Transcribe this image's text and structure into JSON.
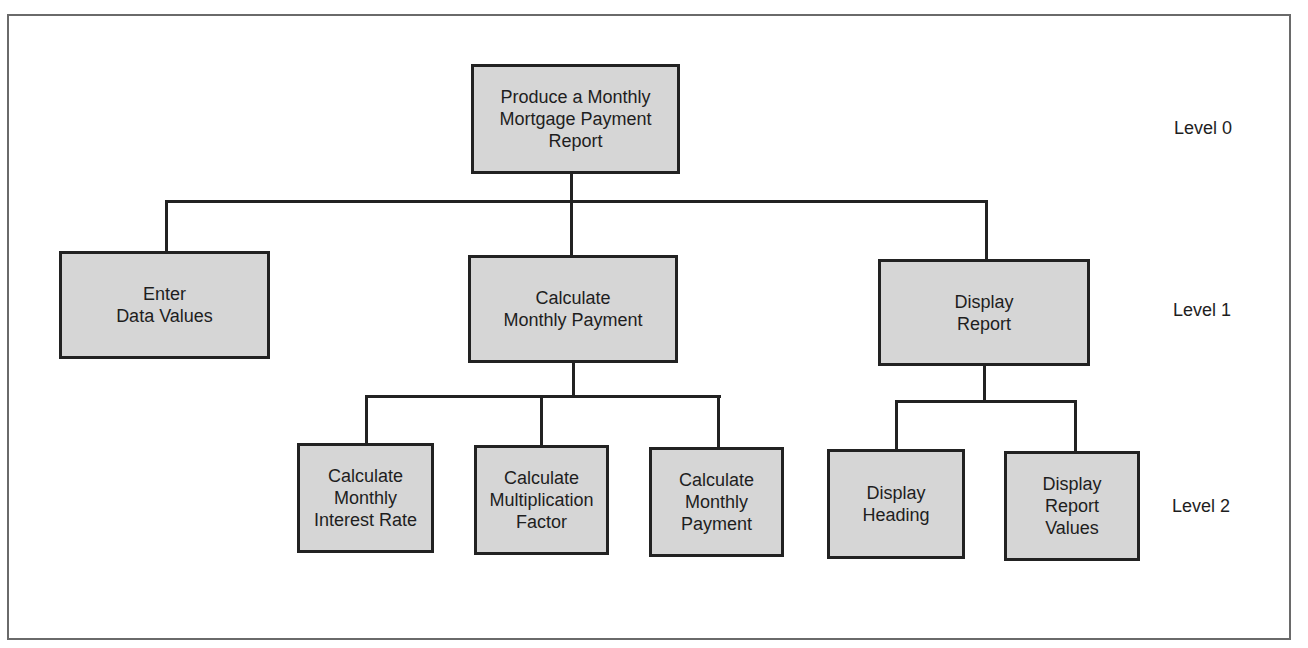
{
  "diagram": {
    "box_fill": "#d6d6d6",
    "line_color": "#222222",
    "levels": [
      {
        "label": "Level 0"
      },
      {
        "label": "Level 1"
      },
      {
        "label": "Level 2"
      }
    ],
    "nodes": {
      "root": {
        "label": "Produce a Monthly\nMortgage Payment\nReport"
      },
      "enter": {
        "label": "Enter\nData Values"
      },
      "calc": {
        "label": "Calculate\nMonthly Payment"
      },
      "display": {
        "label": "Display\nReport"
      },
      "calc_rate": {
        "label": "Calculate\nMonthly\nInterest Rate"
      },
      "calc_factor": {
        "label": "Calculate\nMultiplication\nFactor"
      },
      "calc_payment": {
        "label": "Calculate\nMonthly\nPayment"
      },
      "disp_heading": {
        "label": "Display\nHeading"
      },
      "disp_values": {
        "label": "Display\nReport\nValues"
      }
    },
    "edges": [
      [
        "root",
        "enter"
      ],
      [
        "root",
        "calc"
      ],
      [
        "root",
        "display"
      ],
      [
        "calc",
        "calc_rate"
      ],
      [
        "calc",
        "calc_factor"
      ],
      [
        "calc",
        "calc_payment"
      ],
      [
        "display",
        "disp_heading"
      ],
      [
        "display",
        "disp_values"
      ]
    ]
  }
}
